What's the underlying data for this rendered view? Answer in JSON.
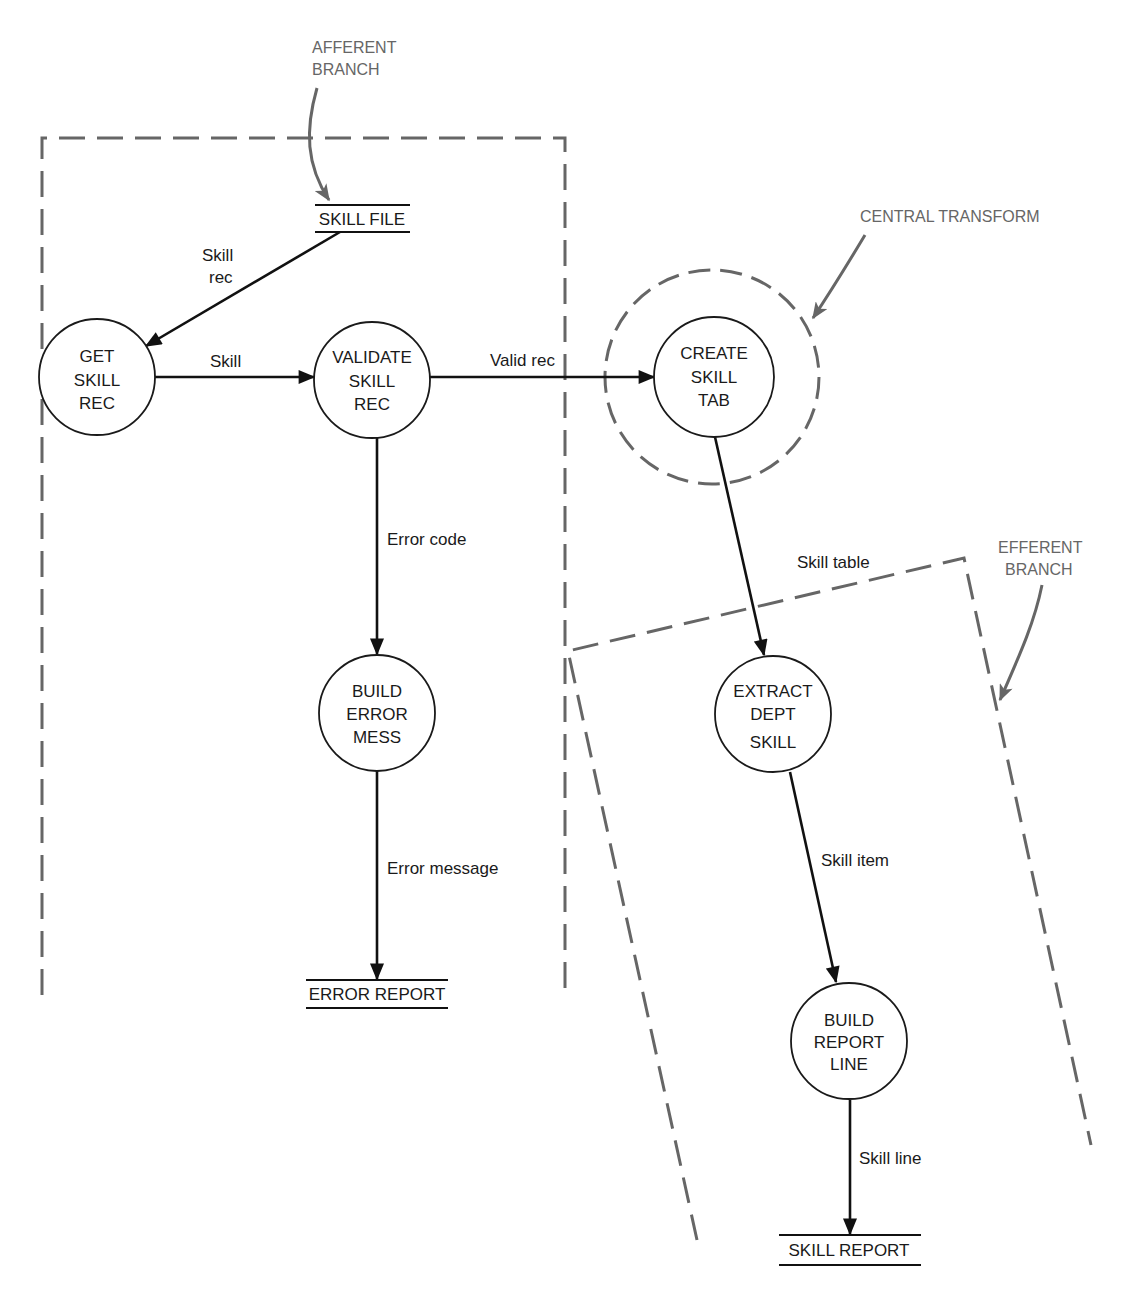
{
  "diagram": {
    "type": "data-flow-diagram",
    "annotations": {
      "afferent": [
        "AFFERENT",
        "BRANCH"
      ],
      "central": "CENTRAL TRANSFORM",
      "efferent": [
        "EFFERENT",
        "BRANCH"
      ]
    },
    "data_stores": {
      "skill_file": "SKILL FILE",
      "error_report": "ERROR REPORT",
      "skill_report": "SKILL REPORT"
    },
    "processes": {
      "get_skill_rec": [
        "GET",
        "SKILL",
        "REC"
      ],
      "validate_skill_rec": [
        "VALIDATE",
        "SKILL",
        "REC"
      ],
      "create_skill_tab": [
        "CREATE",
        "SKILL",
        "TAB"
      ],
      "build_error_mess": [
        "BUILD",
        "ERROR",
        "MESS"
      ],
      "extract_dept_skill": [
        "EXTRACT",
        "DEPT",
        "SKILL"
      ],
      "build_report_line": [
        "BUILD",
        "REPORT",
        "LINE"
      ]
    },
    "flows": {
      "skill_rec": [
        "Skill",
        "rec"
      ],
      "skill": "Skill",
      "valid_rec": "Valid rec",
      "error_code": "Error code",
      "error_message": "Error message",
      "skill_table": "Skill table",
      "skill_item": "Skill item",
      "skill_line": "Skill line"
    },
    "colors": {
      "ink": "#111111",
      "annotation": "#666666",
      "background": "#ffffff"
    }
  }
}
